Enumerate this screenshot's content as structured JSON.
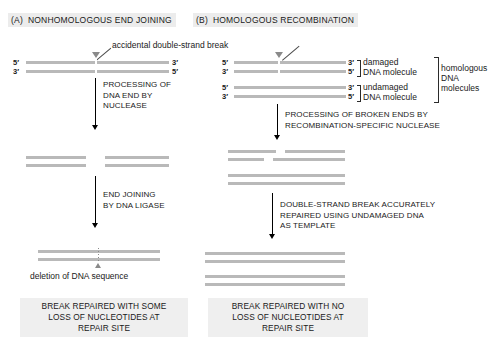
{
  "figure": {
    "title_a_tag": "(A)",
    "title_a": "NONHOMOLOGOUS END JOINING",
    "title_b_tag": "(B)",
    "title_b": "HOMOLOGOUS RECOMBINATION",
    "callout_break": "accidental double-strand break"
  },
  "primes": {
    "five": "5′",
    "three": "3′"
  },
  "panel_a": {
    "step1_text": "PROCESSING OF\nDNA END BY\nNUCLEASE",
    "step2_text": "END JOINING\nBY DNA LIGASE",
    "deletion_caption": "deletion of DNA sequence",
    "conclusion": "BREAK REPAIRED WITH SOME\nLOSS OF NUCLEOTIDES AT\nREPAIR SITE"
  },
  "panel_b": {
    "step1_text": "PROCESSING OF BROKEN ENDS BY\nRECOMBINATION-SPECIFIC NUCLEASE",
    "step2_text": "DOUBLE-STRAND BREAK ACCURATELY\nREPAIRED USING UNDAMAGED DNA\nAS TEMPLATE",
    "label_damaged": "damaged\nDNA molecule",
    "label_undamaged": "undamaged\nDNA molecule",
    "label_homologous": "homologous\nDNA\nmolecules",
    "conclusion": "BREAK REPAIRED WITH NO\nLOSS OF NUCLEOTIDES AT\nREPAIR SITE"
  },
  "colors": {
    "strand": "#b9b9b9",
    "marker": "#8a8a8a",
    "header_bg": "#ececec",
    "caption_bg": "#efefef",
    "text": "#1a1a1a"
  }
}
